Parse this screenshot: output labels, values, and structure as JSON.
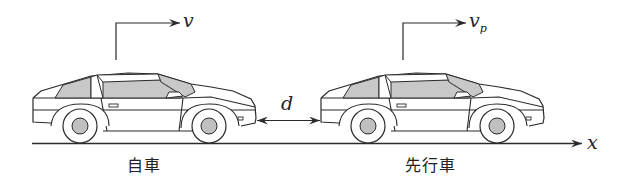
{
  "diagram": {
    "type": "physics-car-following",
    "colors": {
      "stroke": "#2a2a2a",
      "window_fill": "#c8c8c8",
      "hub_fill": "#c0c0c0",
      "background": "#ffffff"
    },
    "own_car": {
      "label": "自車",
      "velocity_symbol": "v"
    },
    "preceding_car": {
      "label": "先行車",
      "velocity_symbol": "v",
      "velocity_subscript": "p"
    },
    "gap": {
      "symbol": "d"
    },
    "axis": {
      "symbol": "x"
    }
  }
}
